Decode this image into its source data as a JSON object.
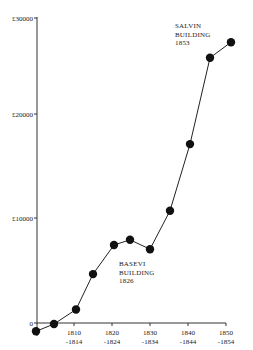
{
  "chart_data": {
    "type": "line",
    "title": "",
    "xlabel": "",
    "ylabel": "",
    "ylim": [
      -1000,
      30000
    ],
    "grid": false,
    "legend": null,
    "y_ticks": [
      {
        "value": 30000,
        "label": "£30000"
      },
      {
        "value": 20000,
        "label": "£20000"
      },
      {
        "value": 10000,
        "label": "£10000"
      },
      {
        "value": 0,
        "label": "0"
      }
    ],
    "x_ticks": [
      {
        "line1": "1810",
        "line2": "-1814"
      },
      {
        "line1": "1820",
        "line2": "-1824"
      },
      {
        "line1": "1830",
        "line2": "-1834"
      },
      {
        "line1": "1840",
        "line2": "-1844"
      },
      {
        "line1": "1850",
        "line2": "-1854"
      }
    ],
    "categories": [
      "1800-1804",
      "1805-1809",
      "1810-1814",
      "1815-1819",
      "1820-1824",
      "1825-1829",
      "1830-1834",
      "1835-1839",
      "1840-1844",
      "1845-1849",
      "1850-1854"
    ],
    "series": [
      {
        "name": "Cumulative value",
        "marker": "filled-circle",
        "values": [
          -800,
          -100,
          1300,
          4700,
          7500,
          8000,
          7100,
          10800,
          17200,
          25500,
          27000
        ]
      }
    ],
    "annotations": [
      {
        "lines": [
          "SALVIN",
          "BUILDING",
          "1853"
        ],
        "near": "1845-1849"
      },
      {
        "lines": [
          "BASEVI",
          "BUILDING",
          "1826"
        ],
        "near": "1825-1829"
      }
    ]
  }
}
